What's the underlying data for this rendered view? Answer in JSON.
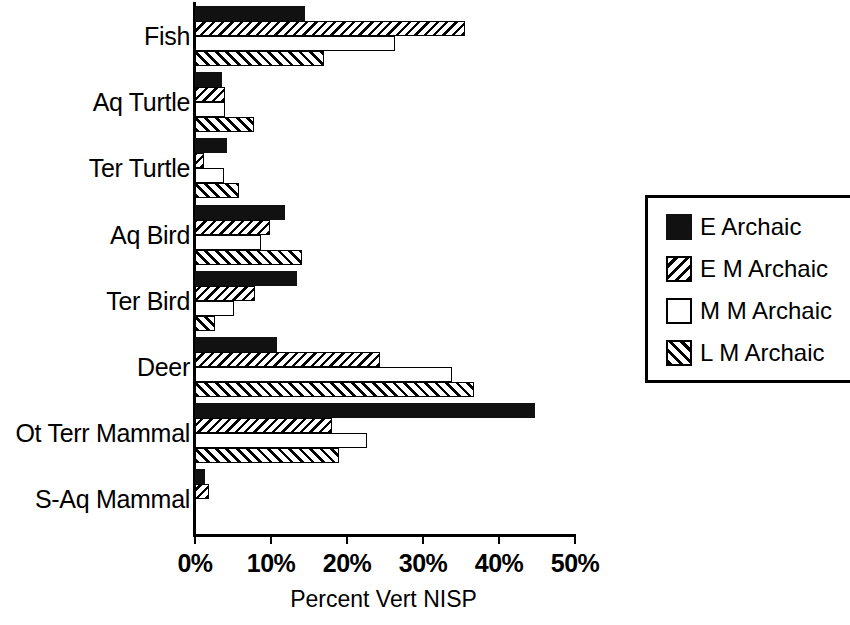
{
  "chart_data": {
    "type": "bar",
    "orientation": "horizontal",
    "title": "",
    "xlabel": "Percent Vert NISP",
    "ylabel": "",
    "xlim": [
      0,
      50
    ],
    "xticks": [
      0,
      10,
      20,
      30,
      40,
      50
    ],
    "xticklabels": [
      "0%",
      "10%",
      "20%",
      "30%",
      "40%",
      "50%"
    ],
    "grid": false,
    "legend_position": "right",
    "categories": [
      "Fish",
      "Aq Turtle",
      "Ter Turtle",
      "Aq Bird",
      "Ter Bird",
      "Deer",
      "Ot Terr Mammal",
      "S-Aq Mammal"
    ],
    "series": [
      {
        "name": "E Archaic",
        "fill": "solid",
        "values": [
          14.5,
          3.5,
          4.2,
          11.8,
          13.4,
          10.8,
          44.7,
          1.3
        ]
      },
      {
        "name": "E M Archaic",
        "fill": "hatch-back",
        "values": [
          35.5,
          4.0,
          1.2,
          9.9,
          7.9,
          24.4,
          18.0,
          1.8
        ]
      },
      {
        "name": "M M Archaic",
        "fill": "empty",
        "values": [
          26.3,
          4.0,
          3.8,
          8.7,
          5.1,
          33.8,
          22.6,
          0.0
        ]
      },
      {
        "name": "L M Archaic",
        "fill": "hatch-fwd",
        "values": [
          17.0,
          7.8,
          5.8,
          14.1,
          2.6,
          36.7,
          18.9,
          0.0
        ]
      }
    ]
  },
  "legend": {
    "items": [
      {
        "label": "E Archaic",
        "fill": "solid"
      },
      {
        "label": "E M Archaic",
        "fill": "hatch-back"
      },
      {
        "label": "M M Archaic",
        "fill": "empty"
      },
      {
        "label": "L M Archaic",
        "fill": "hatch-fwd"
      }
    ]
  },
  "colors": {
    "foreground": "#000000",
    "background": "#ffffff",
    "bar_solid": "#111111"
  }
}
